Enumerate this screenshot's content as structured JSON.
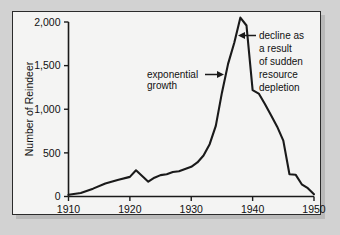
{
  "figure": {
    "panel_bg": "#f4f4f3",
    "outer_bg": "#d2d2d2",
    "border_color": "#2b2b2b",
    "line_color": "#1a1a1a",
    "text_color": "#111111"
  },
  "chart_data": {
    "type": "line",
    "title": "",
    "xlabel": "",
    "ylabel": "Number of Reindeer",
    "xlim": [
      1910,
      1950
    ],
    "ylim": [
      0,
      2000
    ],
    "xticks": [
      1910,
      1920,
      1930,
      1940,
      1950
    ],
    "xtick_labels": [
      "1910",
      "1920",
      "1930",
      "1940",
      "1950"
    ],
    "yticks": [
      0,
      500,
      1000,
      1500,
      2000
    ],
    "ytick_labels": [
      "0",
      "500",
      "1,000",
      "1,500",
      "2,000"
    ],
    "grid": false,
    "legend": false,
    "series": [
      {
        "name": "Reindeer population",
        "x": [
          1910,
          1912,
          1914,
          1916,
          1918,
          1920,
          1921,
          1922,
          1923,
          1924,
          1925,
          1926,
          1927,
          1928,
          1929,
          1930,
          1931,
          1932,
          1933,
          1934,
          1935,
          1936,
          1937,
          1938,
          1939,
          1940,
          1941,
          1942,
          1943,
          1944,
          1945,
          1946,
          1947,
          1948,
          1949,
          1950
        ],
        "values": [
          20,
          40,
          90,
          150,
          190,
          225,
          300,
          235,
          170,
          215,
          245,
          255,
          280,
          290,
          315,
          340,
          390,
          470,
          600,
          810,
          1190,
          1520,
          1760,
          2050,
          1960,
          1220,
          1180,
          1060,
          930,
          800,
          640,
          255,
          250,
          140,
          95,
          25
        ]
      }
    ],
    "annotations": [
      {
        "id": "exponential-growth",
        "lines": [
          "exponential",
          "growth"
        ],
        "arrow": "right",
        "target_x": 1936,
        "target_y": 1430
      },
      {
        "id": "sudden-decline",
        "lines": [
          "decline as",
          "a result",
          "of sudden",
          "resource",
          "depletion"
        ],
        "arrow": "left",
        "target_x": 1938.6,
        "target_y": 1880
      }
    ]
  }
}
